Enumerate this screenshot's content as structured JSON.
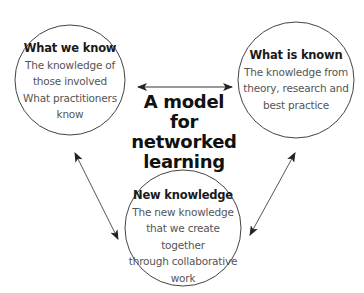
{
  "diagram": {
    "title_lines": [
      "A model for",
      "networked",
      "learning"
    ],
    "nodes": [
      {
        "id": "what-we-know",
        "heading": "What we know",
        "lines": [
          "The knowledge of",
          "those involved",
          "What practitioners",
          "know"
        ]
      },
      {
        "id": "what-is-known",
        "heading": "What is known",
        "lines": [
          "The knowledge from",
          "theory, research and",
          "best practice"
        ]
      },
      {
        "id": "new-knowledge",
        "heading": "New knowledge",
        "lines": [
          "The new knowledge",
          "that we create together",
          "through collaborative",
          "work"
        ]
      }
    ],
    "edges": [
      {
        "from": "what-we-know",
        "to": "what-is-known",
        "type": "bidirectional"
      },
      {
        "from": "what-we-know",
        "to": "new-knowledge",
        "type": "bidirectional"
      },
      {
        "from": "what-is-known",
        "to": "new-knowledge",
        "type": "bidirectional"
      }
    ],
    "colors": {
      "outline": "#444444",
      "heading_text": "#1a1a1a",
      "body_text": "#555555",
      "background": "#ffffff"
    }
  }
}
